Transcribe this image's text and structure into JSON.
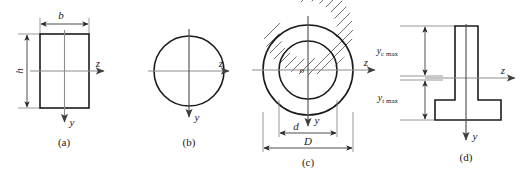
{
  "figure": {
    "colors": {
      "outline": "#1c1c1c",
      "axis": "#8c8c8c",
      "dimension": "#3a3a3a",
      "hatch": "#3d3d3d",
      "background": "#ffffff"
    },
    "panels": [
      {
        "id": "a",
        "caption": "(a)",
        "shape": "rectangle",
        "axes": {
          "horizontal": "z",
          "vertical": "y"
        },
        "dimensions": [
          {
            "name": "width",
            "label": "b",
            "placement": "top"
          },
          {
            "name": "height",
            "label": "h",
            "placement": "left"
          }
        ]
      },
      {
        "id": "b",
        "caption": "(b)",
        "shape": "circle",
        "axes": {
          "horizontal": "z",
          "vertical": "y"
        },
        "dimensions": []
      },
      {
        "id": "c",
        "caption": "(c)",
        "shape": "annulus",
        "axes": {
          "horizontal": "z",
          "vertical": "y"
        },
        "center_label": "o",
        "dimensions": [
          {
            "name": "inner-diameter",
            "label": "d",
            "placement": "bottom-inner"
          },
          {
            "name": "outer-diameter",
            "label": "D",
            "placement": "bottom-outer"
          }
        ]
      },
      {
        "id": "d",
        "caption": "(d)",
        "shape": "inverted-tee",
        "axes": {
          "horizontal": "z",
          "vertical": "y"
        },
        "dimensions": [
          {
            "name": "compression-distance",
            "label": "y",
            "subscript": "c max",
            "placement": "left-upper"
          },
          {
            "name": "tension-distance",
            "label": "y",
            "subscript": "t max",
            "placement": "left-lower"
          }
        ]
      }
    ]
  }
}
